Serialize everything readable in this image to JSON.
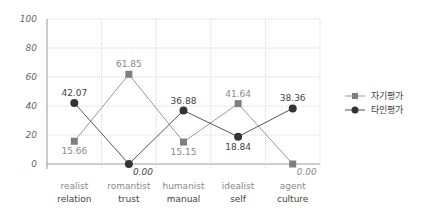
{
  "chart_data": {
    "type": "line",
    "title": "",
    "xlabel": "",
    "ylabel": "",
    "ylim": [
      0,
      100
    ],
    "yticks": [
      0,
      20,
      40,
      60,
      80,
      100
    ],
    "grid": true,
    "legend_position": "right",
    "categories": [
      {
        "line1": "realist",
        "line2": "relation"
      },
      {
        "line1": "romantist",
        "line2": "trust"
      },
      {
        "line1": "humanist",
        "line2": "manual"
      },
      {
        "line1": "idealist",
        "line2": "self"
      },
      {
        "line1": "agent",
        "line2": "culture"
      }
    ],
    "series": [
      {
        "name": "자기평가",
        "marker": "square",
        "color": "#7f7f7f",
        "label_color": "#888888",
        "values": [
          15.66,
          61.85,
          15.15,
          41.64,
          0.0
        ],
        "labels": [
          "15.66",
          "61.85",
          "15.15",
          "41.64",
          "0.00"
        ]
      },
      {
        "name": "타인평가",
        "marker": "circle",
        "color": "#333333",
        "label_color": "#444444",
        "values": [
          42.07,
          0.0,
          36.88,
          18.84,
          38.36
        ],
        "labels": [
          "42.07",
          "0.00",
          "36.88",
          "18.84",
          "38.36"
        ]
      }
    ]
  }
}
